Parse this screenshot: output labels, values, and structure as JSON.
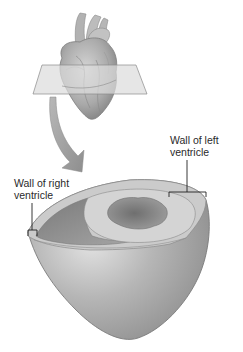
{
  "diagram": {
    "title": "",
    "labels": {
      "left_ventricle_line1": "Wall of left",
      "left_ventricle_line2": "ventricle",
      "right_ventricle_line1": "Wall of right",
      "right_ventricle_line2": "ventricle"
    },
    "elements": [
      "heart-illustration",
      "section-plane",
      "curved-arrow",
      "ventricle-cross-section"
    ],
    "colors": {
      "background": "#ffffff",
      "tissue_light": "#d0d0d0",
      "tissue_mid": "#a8a8a8",
      "tissue_dark": "#707070",
      "plane": "#d8d8d8",
      "arrow": "#9a9a9a",
      "line": "#222222"
    }
  }
}
